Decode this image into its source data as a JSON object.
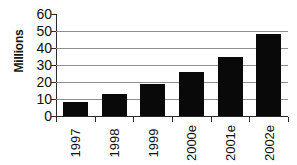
{
  "chart_data": {
    "type": "bar",
    "title": "",
    "subtitle": "",
    "xlabel": "",
    "ylabel": "Millions",
    "categories": [
      "1997",
      "1998",
      "1999",
      "2000e",
      "2001e",
      "2002e"
    ],
    "values": [
      8,
      13,
      19,
      26,
      35,
      48
    ],
    "series": [
      {
        "name": "Millions",
        "values": [
          8,
          13,
          19,
          26,
          35,
          48
        ]
      }
    ],
    "ylim": [
      0,
      60
    ],
    "ytick_labels": [
      "60",
      "50",
      "40",
      "30",
      "20",
      "10",
      "0"
    ],
    "ytick_values": [
      60,
      50,
      40,
      30,
      20,
      10,
      0
    ],
    "ytick_step": 10,
    "grid": "horizontal",
    "gridline_values": [
      50,
      40,
      30,
      20,
      10,
      0
    ],
    "legend": "none",
    "legend_position": "none",
    "orientation": "vertical",
    "xlabel_rotation": -90,
    "ylabel_rotation": -90,
    "colors": {
      "bar": "#090909",
      "gridline": "#8f8f8f",
      "axis": "#2a2a2a",
      "text": "#111111",
      "background": "#ffffff"
    }
  }
}
